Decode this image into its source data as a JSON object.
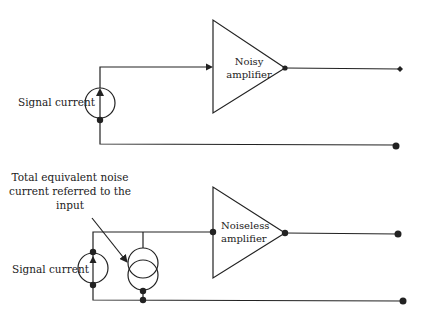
{
  "top_circuit": {
    "source_label": "Signal current",
    "amplifier_label_line1": "Noisy",
    "amplifier_label_line2": "amplifier"
  },
  "bottom_circuit": {
    "source_label": "Signal current",
    "noise_label_line1": "Total equivalent noise",
    "noise_label_line2": "current referred to the",
    "noise_label_line3": "input",
    "amplifier_label_line1": "Noiseless",
    "amplifier_label_line2": "amplifier"
  },
  "colors": {
    "line": "#222222",
    "background": "#ffffff"
  }
}
